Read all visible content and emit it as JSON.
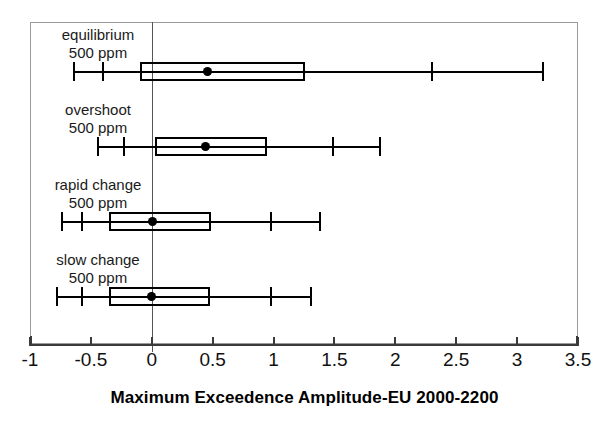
{
  "chart_data": {
    "type": "box",
    "title": "",
    "xlabel": "Maximum Exceedence Amplitude-EU 2000-2200",
    "ylabel": "",
    "xlim": [
      -1,
      3.5
    ],
    "xticks": [
      -1,
      -0.5,
      0,
      0.5,
      1,
      1.5,
      2,
      2.5,
      3,
      3.5
    ],
    "xticklabels": [
      "-1",
      "-0.5",
      "0",
      "0.5",
      "1",
      "1.5",
      "2",
      "2.5",
      "3",
      "3.5"
    ],
    "grid": false,
    "legend": "none",
    "reference_line_x": 0,
    "categories": [
      "equilibrium 500 ppm",
      "overshoot 500 ppm",
      "rapid change 500 ppm",
      "slow change 500 ppm"
    ],
    "boxes": [
      {
        "label_line1": "equilibrium",
        "label_line2": "500 ppm",
        "whisker_low": -0.64,
        "cap_low": -0.4,
        "q1": -0.1,
        "mean": 0.46,
        "q3": 1.26,
        "cap_high": 2.3,
        "whisker_high": 3.21
      },
      {
        "label_line1": "overshoot",
        "label_line2": "500 ppm",
        "whisker_low": -0.44,
        "cap_low": -0.23,
        "q1": 0.03,
        "mean": 0.44,
        "q3": 0.95,
        "cap_high": 1.49,
        "whisker_high": 1.87
      },
      {
        "label_line1": "rapid change",
        "label_line2": "500 ppm",
        "whisker_low": -0.74,
        "cap_low": -0.57,
        "q1": -0.35,
        "mean": 0.01,
        "q3": 0.49,
        "cap_high": 0.98,
        "whisker_high": 1.38
      },
      {
        "label_line1": "slow change",
        "label_line2": "500 ppm",
        "whisker_low": -0.78,
        "cap_low": -0.57,
        "q1": -0.35,
        "mean": 0.0,
        "q3": 0.48,
        "cap_high": 0.98,
        "whisker_high": 1.31
      }
    ]
  }
}
